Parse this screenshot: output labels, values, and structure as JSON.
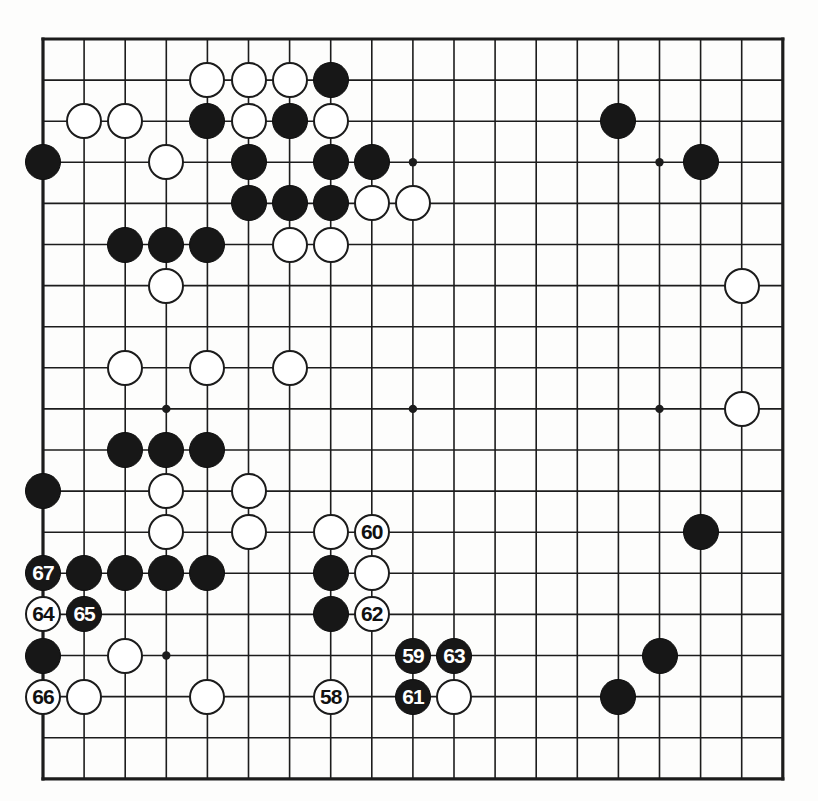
{
  "page": {
    "caption_top": "",
    "background": "#fdfdfc"
  },
  "board": {
    "size": 19,
    "origin_x": 43,
    "origin_y": 39,
    "spacing": 41.1,
    "line_color": "#1c1c1c",
    "line_width": 1.6,
    "border_width": 3.2,
    "stone_radius": 18,
    "star_radius": 4.2,
    "star_points": [
      {
        "col": 4,
        "row": 4
      },
      {
        "col": 10,
        "row": 4
      },
      {
        "col": 16,
        "row": 4
      },
      {
        "col": 4,
        "row": 10
      },
      {
        "col": 10,
        "row": 10
      },
      {
        "col": 16,
        "row": 10
      },
      {
        "col": 4,
        "row": 16
      },
      {
        "col": 10,
        "row": 16
      },
      {
        "col": 16,
        "row": 16
      }
    ],
    "colors": {
      "black_stone": "#171717",
      "white_stone": "#ffffff",
      "stone_outline": "#1b1b1b",
      "label_on_black": "#ffffff",
      "label_on_white": "#111111"
    }
  },
  "stones": [
    {
      "col": 5,
      "row": 2,
      "color": "white"
    },
    {
      "col": 6,
      "row": 2,
      "color": "white"
    },
    {
      "col": 7,
      "row": 2,
      "color": "white"
    },
    {
      "col": 8,
      "row": 2,
      "color": "black"
    },
    {
      "col": 2,
      "row": 3,
      "color": "white"
    },
    {
      "col": 3,
      "row": 3,
      "color": "white"
    },
    {
      "col": 5,
      "row": 3,
      "color": "black"
    },
    {
      "col": 6,
      "row": 3,
      "color": "white"
    },
    {
      "col": 7,
      "row": 3,
      "color": "black"
    },
    {
      "col": 8,
      "row": 3,
      "color": "white"
    },
    {
      "col": 15,
      "row": 3,
      "color": "black"
    },
    {
      "col": 1,
      "row": 4,
      "color": "black"
    },
    {
      "col": 4,
      "row": 4,
      "color": "white"
    },
    {
      "col": 6,
      "row": 4,
      "color": "black"
    },
    {
      "col": 8,
      "row": 4,
      "color": "black"
    },
    {
      "col": 9,
      "row": 4,
      "color": "black"
    },
    {
      "col": 17,
      "row": 4,
      "color": "black"
    },
    {
      "col": 6,
      "row": 5,
      "color": "black"
    },
    {
      "col": 7,
      "row": 5,
      "color": "black"
    },
    {
      "col": 8,
      "row": 5,
      "color": "black"
    },
    {
      "col": 9,
      "row": 5,
      "color": "white"
    },
    {
      "col": 10,
      "row": 5,
      "color": "white"
    },
    {
      "col": 3,
      "row": 6,
      "color": "black"
    },
    {
      "col": 4,
      "row": 6,
      "color": "black"
    },
    {
      "col": 5,
      "row": 6,
      "color": "black"
    },
    {
      "col": 7,
      "row": 6,
      "color": "white"
    },
    {
      "col": 8,
      "row": 6,
      "color": "white"
    },
    {
      "col": 4,
      "row": 7,
      "color": "white"
    },
    {
      "col": 18,
      "row": 7,
      "color": "white"
    },
    {
      "col": 3,
      "row": 9,
      "color": "white"
    },
    {
      "col": 5,
      "row": 9,
      "color": "white"
    },
    {
      "col": 7,
      "row": 9,
      "color": "white"
    },
    {
      "col": 18,
      "row": 10,
      "color": "white"
    },
    {
      "col": 3,
      "row": 11,
      "color": "black"
    },
    {
      "col": 4,
      "row": 11,
      "color": "black"
    },
    {
      "col": 5,
      "row": 11,
      "color": "black"
    },
    {
      "col": 1,
      "row": 12,
      "color": "black"
    },
    {
      "col": 4,
      "row": 12,
      "color": "white"
    },
    {
      "col": 6,
      "row": 12,
      "color": "white"
    },
    {
      "col": 4,
      "row": 13,
      "color": "white"
    },
    {
      "col": 6,
      "row": 13,
      "color": "white"
    },
    {
      "col": 8,
      "row": 13,
      "color": "white"
    },
    {
      "col": 17,
      "row": 13,
      "color": "black"
    },
    {
      "col": 2,
      "row": 14,
      "color": "black"
    },
    {
      "col": 3,
      "row": 14,
      "color": "black"
    },
    {
      "col": 4,
      "row": 14,
      "color": "black"
    },
    {
      "col": 5,
      "row": 14,
      "color": "black"
    },
    {
      "col": 8,
      "row": 14,
      "color": "black"
    },
    {
      "col": 9,
      "row": 14,
      "color": "white"
    },
    {
      "col": 8,
      "row": 15,
      "color": "black"
    },
    {
      "col": 1,
      "row": 16,
      "color": "black"
    },
    {
      "col": 3,
      "row": 16,
      "color": "white"
    },
    {
      "col": 16,
      "row": 16,
      "color": "black"
    },
    {
      "col": 2,
      "row": 17,
      "color": "white"
    },
    {
      "col": 5,
      "row": 17,
      "color": "white"
    },
    {
      "col": 11,
      "row": 17,
      "color": "white"
    },
    {
      "col": 15,
      "row": 17,
      "color": "black"
    }
  ],
  "numbered_moves": [
    {
      "label": "58",
      "col": 8,
      "row": 17,
      "color": "white"
    },
    {
      "label": "59",
      "col": 10,
      "row": 16,
      "color": "black"
    },
    {
      "label": "60",
      "col": 9,
      "row": 13,
      "color": "white"
    },
    {
      "label": "61",
      "col": 10,
      "row": 17,
      "color": "black"
    },
    {
      "label": "62",
      "col": 9,
      "row": 15,
      "color": "white"
    },
    {
      "label": "63",
      "col": 11,
      "row": 16,
      "color": "black"
    },
    {
      "label": "64",
      "col": 1,
      "row": 15,
      "color": "white"
    },
    {
      "label": "65",
      "col": 2,
      "row": 15,
      "color": "black"
    },
    {
      "label": "66",
      "col": 1,
      "row": 17,
      "color": "white"
    },
    {
      "label": "67",
      "col": 1,
      "row": 14,
      "color": "black"
    }
  ],
  "chart_data": {
    "type": "table",
    "move_range": "58-67",
    "black_moves": [
      "59",
      "61",
      "63",
      "65",
      "67"
    ],
    "white_moves": [
      "58",
      "60",
      "62",
      "64",
      "66"
    ],
    "total_black_stones": 33,
    "total_white_stones": 30
  }
}
